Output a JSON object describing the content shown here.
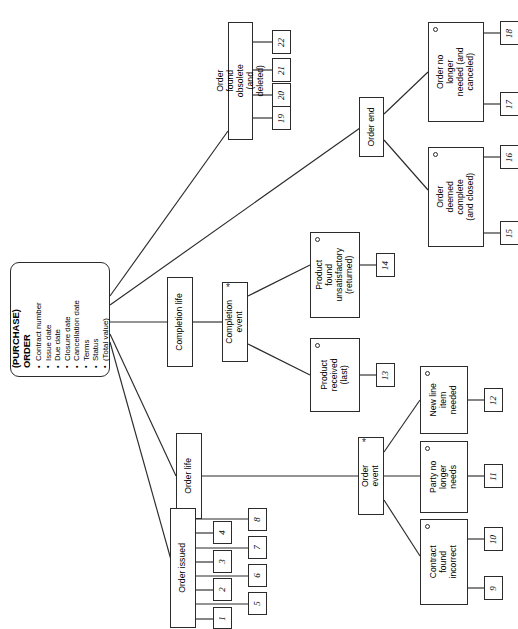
{
  "diagram": {
    "orientation": "rotated-90-ccw",
    "line_color": "#2b2b2b",
    "box_fill": "#ffffff",
    "page_background": "#ffffff"
  },
  "root": {
    "title": "(PURCHASE)\nORDER",
    "attributes": [
      "Contract number",
      "Issue date",
      "Due date",
      "Closure date",
      "Cancellation date",
      "Terms",
      "Status",
      "(Total value)"
    ]
  },
  "nodes": {
    "order_found_obsolete": {
      "label": "Order found\nobsolete (and deleted)",
      "marker": ""
    },
    "order_end": {
      "label": "Order end",
      "marker": ""
    },
    "order_no_longer_needed": {
      "label": "Order no longer\nneeded (and\ncanceled)",
      "marker": "circle"
    },
    "order_deemed_complete": {
      "label": "Order deemed\ncomplete (and\nclosed)",
      "marker": "circle"
    },
    "completion_life": {
      "label": "Completion life",
      "marker": ""
    },
    "completion_event": {
      "label": "Completion\nevent",
      "marker": "asterisk"
    },
    "product_found_unsatisfactory": {
      "label": "Product found\nunsatisfactory (returned)",
      "marker": "circle"
    },
    "product_received": {
      "label": "Product\nreceived (last)",
      "marker": "circle"
    },
    "order_life": {
      "label": "Order life",
      "marker": ""
    },
    "order_event": {
      "label": "Order\nevent",
      "marker": "asterisk"
    },
    "new_line_item_needed": {
      "label": "New line\nitem needed",
      "marker": "circle"
    },
    "party_no_longer_needs": {
      "label": "Party no\nlonger needs",
      "marker": "circle"
    },
    "contract_found_incorrect": {
      "label": "Contract\nfound incorrect",
      "marker": "circle"
    },
    "order_issued": {
      "label": "Order issued",
      "marker": ""
    }
  },
  "numbered_boxes": {
    "n1": "1",
    "n2": "2",
    "n3": "3",
    "n4": "4",
    "n5": "5",
    "n6": "6",
    "n7": "7",
    "n8": "8",
    "n9": "9",
    "n10": "10",
    "n11": "11",
    "n12": "12",
    "n13": "13",
    "n14": "14",
    "n15": "15",
    "n16": "16",
    "n17": "17",
    "n18": "18",
    "n19": "19",
    "n20": "20",
    "n21": "21",
    "n22": "22"
  }
}
